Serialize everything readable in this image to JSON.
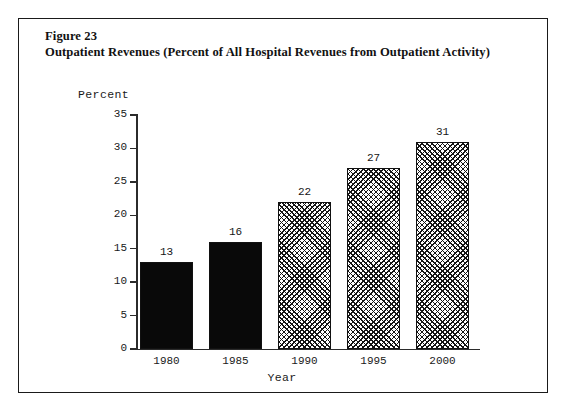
{
  "figure": {
    "number_label": "Figure 23",
    "title": "Outpatient Revenues (Percent of All Hospital Revenues from Outpatient Activity)"
  },
  "chart_data": {
    "type": "bar",
    "title": "Outpatient Revenues (Percent of All Hospital Revenues from Outpatient Activity)",
    "categories": [
      "1980",
      "1985",
      "1990",
      "1995",
      "2000"
    ],
    "values": [
      13,
      16,
      22,
      27,
      31
    ],
    "value_labels": [
      "13",
      "16",
      "22",
      "27",
      "31"
    ],
    "series": [
      {
        "name": "Percent of All Hospital Revenues from Outpatient Activity",
        "values": [
          13,
          16,
          22,
          27,
          31
        ]
      }
    ],
    "bar_fills": [
      "solid",
      "solid",
      "crosshatch",
      "crosshatch",
      "crosshatch"
    ],
    "xlabel": "Year",
    "ylabel": "Percent",
    "ylim": [
      0,
      35
    ],
    "ytick_values": [
      0,
      5,
      10,
      15,
      20,
      25,
      30,
      35
    ],
    "ytick_labels": [
      "0",
      "5",
      "10",
      "15",
      "20",
      "25",
      "30",
      "35"
    ],
    "xtick_labels": [
      "1980",
      "1985",
      "1990",
      "1995",
      "2000"
    ],
    "grid": false,
    "legend": null,
    "colors": {
      "solid_bar": "#090909",
      "hatch_line": "#141414",
      "bar_outline": "#111111",
      "axis": "#2b2b2b",
      "frame": "#1a1a1a",
      "text": "#1a1a1a",
      "background": "#ffffff"
    }
  }
}
